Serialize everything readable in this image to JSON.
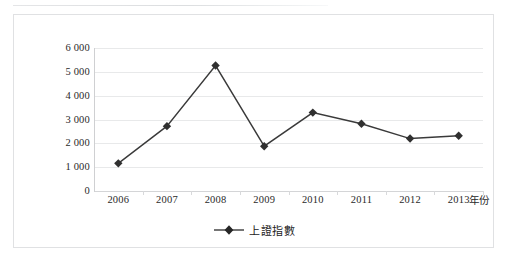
{
  "chart_data": {
    "type": "line",
    "title": "",
    "xlabel": "年份",
    "ylabel": "",
    "categories": [
      "2006",
      "2007",
      "2008",
      "2009",
      "2010",
      "2011",
      "2012",
      "2013"
    ],
    "series": [
      {
        "name": "上證指數",
        "values": [
          1160,
          2720,
          5265,
          1880,
          3290,
          2820,
          2200,
          2320
        ]
      }
    ],
    "ylim": [
      0,
      6000
    ],
    "yticks": [
      0,
      1000,
      2000,
      3000,
      4000,
      5000,
      6000
    ],
    "ytick_labels": [
      "0",
      "1 000",
      "2 000",
      "3 000",
      "4 000",
      "5 000",
      "6 000"
    ],
    "grid": true,
    "legend_position": "bottom",
    "marker": "diamond",
    "line_color": "#3a3a3a",
    "marker_color": "#303030",
    "gridline_color": "#e8e9ea"
  },
  "legend": {
    "entries": [
      {
        "label": "上證指數",
        "marker": "diamond-marker-icon"
      }
    ]
  },
  "axis": {
    "x_title": "年份"
  }
}
